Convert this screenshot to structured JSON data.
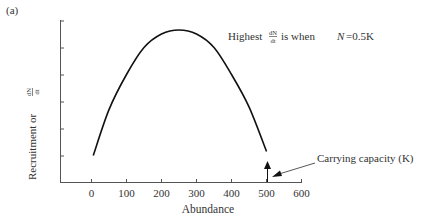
{
  "panel_label": "(a)",
  "chart_data": {
    "type": "line",
    "title": "",
    "xlabel": "Abundance",
    "ylabel_prefix": "Recruitment or",
    "ylabel_frac_num": "dN",
    "ylabel_frac_den": "dt",
    "xlim": [
      -80,
      600
    ],
    "ylim": [
      0,
      6
    ],
    "x_ticks": [
      0,
      100,
      200,
      300,
      400,
      500,
      600
    ],
    "x_tick_labels": [
      "0",
      "100",
      "200",
      "300",
      "400",
      "500",
      "600"
    ],
    "y_ticks": [
      1,
      2,
      3,
      4,
      5,
      6
    ],
    "y_tick_labels": [],
    "grid": false,
    "series": [
      {
        "name": "Recruitment curve",
        "x": [
          5,
          50,
          100,
          150,
          200,
          250,
          300,
          350,
          400,
          450,
          500
        ],
        "y": [
          1.0,
          2.7,
          4.0,
          5.0,
          5.5,
          5.65,
          5.5,
          5.0,
          4.0,
          2.8,
          1.15
        ]
      }
    ],
    "annotations": [
      {
        "text_prefix": "Highest",
        "frac_num": "dN",
        "frac_den": "dt",
        "text_suffix_1": "is when",
        "text_var": "N",
        "text_suffix_2": "=0.5K",
        "near_x": 250
      },
      {
        "text": "Carrying capacity (K)",
        "points_to_x": 500,
        "arrow": true
      }
    ]
  }
}
